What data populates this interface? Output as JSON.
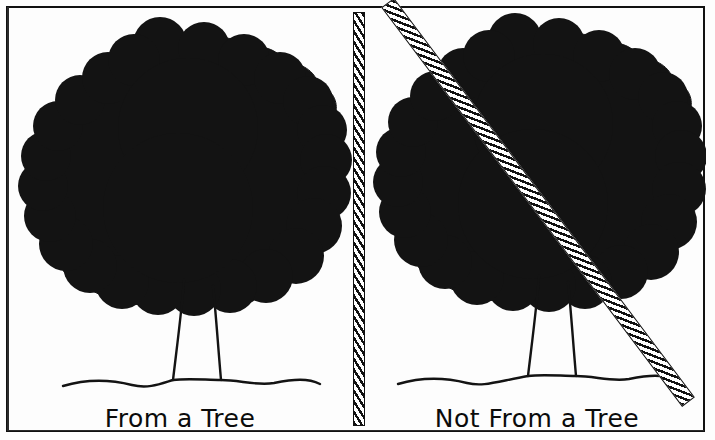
{
  "figure": {
    "kind": "two-panel-cartoon-diagram",
    "width": 715,
    "height": 440,
    "background_color": "#fdfdfd",
    "ink_color": "#111111",
    "frame": {
      "name": "outer-border",
      "style": "thin hand-drawn rectangle"
    }
  },
  "panels": [
    {
      "id": "left",
      "caption": "From a Tree",
      "tree": {
        "canopy": "solid black lobed/scalloped blob",
        "trunk": "two thin flaring vertical strokes",
        "ground": "wavy horizontal ground line"
      },
      "negated": false
    },
    {
      "id": "right",
      "caption": "Not From a Tree",
      "tree": {
        "canopy": "solid black lobed/scalloped blob",
        "trunk": "two thin flaring vertical strokes",
        "ground": "wavy horizontal ground line"
      },
      "negated": true,
      "negation_mark": "diagonal hatched slash bar crossing the tree"
    }
  ],
  "divider": {
    "name": "vertical-hatched-divider",
    "orientation": "vertical",
    "fill": "white with black diagonal hatching",
    "x": 353,
    "top": 12,
    "bottom": 426
  },
  "slash": {
    "name": "diagonal-hatched-slash",
    "orientation": "top-left to bottom-right",
    "fill": "white with black diagonal hatching"
  },
  "captions": {
    "left": "From a Tree",
    "right": "Not From a Tree"
  }
}
